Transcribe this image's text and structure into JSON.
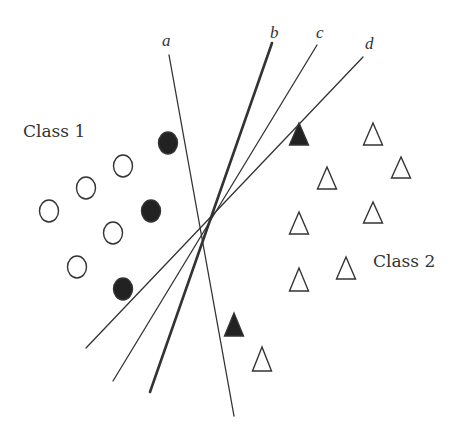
{
  "diagram": {
    "type": "linear-classifier-decision-boundaries",
    "colors": {
      "ink": "#333333",
      "fill": "#222222",
      "background": "#ffffff"
    },
    "classes": [
      {
        "id": "class1",
        "label": "Class 1",
        "label_pos": [
          23,
          137
        ],
        "marker": "circle"
      },
      {
        "id": "class2",
        "label": "Class 2",
        "label_pos": [
          373,
          267
        ],
        "marker": "triangle"
      }
    ],
    "lines": [
      {
        "id": "a",
        "label": "a",
        "label_pos": [
          162,
          46
        ],
        "from": [
          169,
          55
        ],
        "to": [
          234,
          416
        ],
        "width": 1.3
      },
      {
        "id": "b",
        "label": "b",
        "label_pos": [
          270,
          38
        ],
        "from": [
          272,
          43
        ],
        "to": [
          150,
          392
        ],
        "width": 2.6
      },
      {
        "id": "c",
        "label": "c",
        "label_pos": [
          316,
          38
        ],
        "from": [
          317,
          45
        ],
        "to": [
          113,
          381
        ],
        "width": 1.3
      },
      {
        "id": "d",
        "label": "d",
        "label_pos": [
          365,
          49
        ],
        "from": [
          363,
          57
        ],
        "to": [
          86,
          348
        ],
        "width": 1.3
      }
    ],
    "circles": [
      {
        "cx": 168,
        "cy": 143,
        "filled": true
      },
      {
        "cx": 123,
        "cy": 166,
        "filled": false
      },
      {
        "cx": 86,
        "cy": 188,
        "filled": false
      },
      {
        "cx": 49,
        "cy": 211,
        "filled": false
      },
      {
        "cx": 151,
        "cy": 211,
        "filled": true
      },
      {
        "cx": 113,
        "cy": 233,
        "filled": false
      },
      {
        "cx": 77,
        "cy": 267,
        "filled": false
      },
      {
        "cx": 123,
        "cy": 289,
        "filled": true
      }
    ],
    "triangles": [
      {
        "cx": 299,
        "apex": 123,
        "base": 145,
        "filled": true
      },
      {
        "cx": 373,
        "apex": 123,
        "base": 145,
        "filled": false
      },
      {
        "cx": 401,
        "apex": 157,
        "base": 178,
        "filled": false
      },
      {
        "cx": 327,
        "apex": 167,
        "base": 189,
        "filled": false
      },
      {
        "cx": 373,
        "apex": 202,
        "base": 223,
        "filled": false
      },
      {
        "cx": 299,
        "apex": 212,
        "base": 234,
        "filled": false
      },
      {
        "cx": 346,
        "apex": 257,
        "base": 279,
        "filled": false
      },
      {
        "cx": 299,
        "apex": 268,
        "base": 291,
        "filled": false
      },
      {
        "cx": 234,
        "apex": 313,
        "base": 336,
        "filled": true
      },
      {
        "cx": 262,
        "apex": 347,
        "base": 371,
        "filled": false
      }
    ]
  }
}
